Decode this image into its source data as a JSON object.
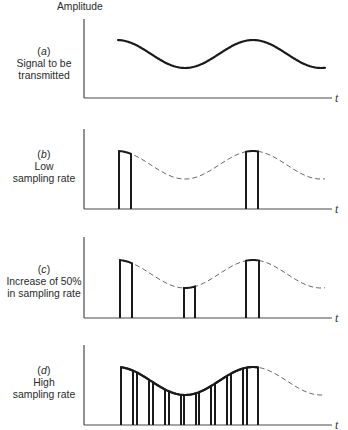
{
  "figure": {
    "y_axis_label": "Amplitude",
    "x_axis_label": "t",
    "colors": {
      "axis": "#4a4a4a",
      "signal": "#1a1a1a",
      "dashed": "#6a6a6a",
      "text": "#2a2a2a"
    },
    "signal": {
      "peak_x": 117,
      "period_px": 136,
      "amplitude_px": 14,
      "center_above_baseline_px": 44,
      "start_x": 118,
      "end_x": 325
    },
    "axis": {
      "x": 84,
      "x_end": 332
    },
    "panels": [
      {
        "key": "a",
        "tag": {
          "open": "(",
          "letter": "a",
          "close": ")"
        },
        "caption": [
          "Signal to be",
          "transmitted"
        ],
        "axis_top": 19,
        "baseline": 98,
        "label_top": 46,
        "mode": "continuous",
        "samples": []
      },
      {
        "key": "b",
        "tag": {
          "open": "(",
          "letter": "b",
          "close": ")"
        },
        "caption": [
          "Low",
          "sampling rate"
        ],
        "axis_top": 129,
        "baseline": 209,
        "label_top": 149,
        "mode": "sampled",
        "samples": [
          [
            119,
            131
          ],
          [
            246,
            258
          ]
        ]
      },
      {
        "key": "c",
        "tag": {
          "open": "(",
          "letter": "c",
          "close": ")"
        },
        "caption": [
          "Increase of 50%",
          "in sampling rate"
        ],
        "axis_top": 237,
        "baseline": 318,
        "label_top": 264,
        "mode": "sampled",
        "samples": [
          [
            120,
            132
          ],
          [
            184,
            195
          ],
          [
            246,
            259
          ]
        ]
      },
      {
        "key": "d",
        "tag": {
          "open": "(",
          "letter": "d",
          "close": ")"
        },
        "caption": [
          "High",
          "sampling rate"
        ],
        "axis_top": 345,
        "baseline": 425,
        "label_top": 365,
        "mode": "sampled-continuous-top",
        "samples": [
          [
            121,
            133
          ],
          [
            137,
            149
          ],
          [
            153,
            165
          ],
          [
            169,
            181
          ],
          [
            184,
            196
          ],
          [
            199,
            211
          ],
          [
            215,
            227
          ],
          [
            231,
            243
          ],
          [
            247,
            258
          ]
        ]
      }
    ]
  }
}
